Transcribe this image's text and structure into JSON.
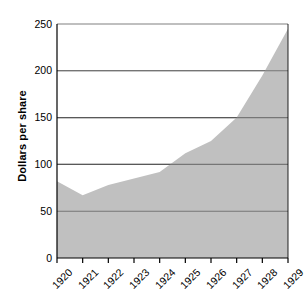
{
  "chart_data": {
    "type": "area",
    "title": "",
    "subtitle": "",
    "xlabel": "",
    "ylabel": "Dollars per share",
    "categories": [
      "1920",
      "1921",
      "1922",
      "1923",
      "1924",
      "1925",
      "1926",
      "1927",
      "1928",
      "1929"
    ],
    "x": [
      1920,
      1921,
      1922,
      1923,
      1924,
      1925,
      1926,
      1927,
      1928,
      1929
    ],
    "values": [
      82,
      67,
      78,
      85,
      92,
      112,
      125,
      150,
      195,
      245
    ],
    "series": [
      {
        "name": "Dollars per share",
        "values": [
          82,
          67,
          78,
          85,
          92,
          112,
          125,
          150,
          195,
          245
        ]
      }
    ],
    "ylim": [
      0,
      250
    ],
    "yticks": [
      0,
      50,
      100,
      150,
      200,
      250
    ],
    "ytick_labels": [
      "0",
      "50",
      "100",
      "150",
      "200",
      "250"
    ],
    "xticks": [
      1920,
      1921,
      1922,
      1923,
      1924,
      1925,
      1926,
      1927,
      1928,
      1929
    ],
    "xtick_labels": [
      "1920",
      "1921",
      "1922",
      "1923",
      "1924",
      "1925",
      "1926",
      "1927",
      "1928",
      "1929"
    ],
    "grid": true,
    "grid_axis": "y",
    "legend": false,
    "legend_position": "none",
    "fill_color": "#c0c0c0",
    "line_color": "#c0c0c0",
    "grid_color": "#808080",
    "axis_color": "#000000",
    "background_color": "#ffffff",
    "annotations": []
  },
  "axes": {
    "y_title": "Dollars per share",
    "y_labels": [
      "250",
      "200",
      "150",
      "100",
      "50",
      "0"
    ],
    "x_labels": [
      "1920",
      "1921",
      "1922",
      "1923",
      "1924",
      "1925",
      "1926",
      "1927",
      "1928",
      "1929"
    ]
  }
}
